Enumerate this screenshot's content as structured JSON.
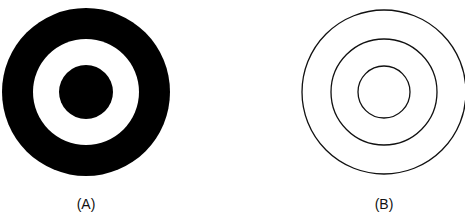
{
  "figures": [
    {
      "id": "A",
      "label": "(A)",
      "style": "filled",
      "center": [
        86,
        92
      ],
      "rings": [
        {
          "r": 84,
          "fill": "#000000"
        },
        {
          "r": 53,
          "fill": "#ffffff"
        },
        {
          "r": 27,
          "fill": "#000000"
        }
      ]
    },
    {
      "id": "B",
      "label": "(B)",
      "style": "outline",
      "center": [
        384,
        92
      ],
      "stroke": "#111111",
      "rings": [
        {
          "r": 82
        },
        {
          "r": 53
        },
        {
          "r": 26
        }
      ]
    }
  ]
}
